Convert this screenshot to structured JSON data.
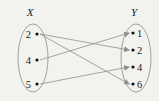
{
  "diagram": {
    "type": "mapping",
    "domain_label": "X",
    "codomain_label": "Y",
    "domain": [
      {
        "label": "2",
        "x": 37,
        "y": 34
      },
      {
        "label": "4",
        "x": 37,
        "y": 60
      },
      {
        "label": "5",
        "x": 37,
        "y": 84
      }
    ],
    "codomain": [
      {
        "label": "1",
        "x": 133,
        "y": 33
      },
      {
        "label": "2",
        "x": 133,
        "y": 50
      },
      {
        "label": "4",
        "x": 133,
        "y": 67
      },
      {
        "label": "6",
        "x": 133,
        "y": 84
      }
    ],
    "mappings": [
      {
        "from": "2",
        "to": "2"
      },
      {
        "from": "2",
        "to": "6"
      },
      {
        "from": "4",
        "to": "1"
      },
      {
        "from": "5",
        "to": "4"
      }
    ],
    "colors": {
      "background": "#f2f2ee",
      "ellipse": "#8a8a8a",
      "arrow": "#8f8f8f",
      "point": "#111111",
      "text": "#222222"
    }
  }
}
